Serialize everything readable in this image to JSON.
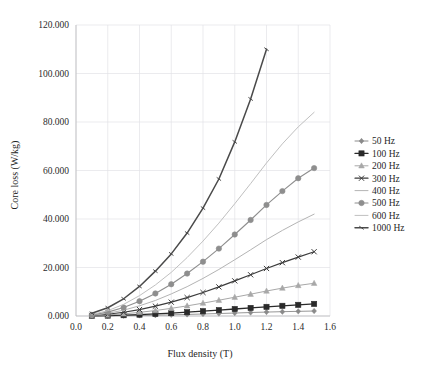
{
  "chart_data": {
    "type": "line",
    "title": "",
    "xlabel": "Flux density (T)",
    "ylabel": "Core loss (W/kg)",
    "xlim": [
      0.0,
      1.6
    ],
    "ylim": [
      0.0,
      120.0
    ],
    "xticks": [
      "0.0",
      "0.2",
      "0.4",
      "0.6",
      "0.8",
      "1.0",
      "1.2",
      "1.4",
      "1.6"
    ],
    "xtick_values": [
      0.0,
      0.2,
      0.4,
      0.6,
      0.8,
      1.0,
      1.2,
      1.4,
      1.6
    ],
    "yticks": [
      "0.000",
      "20.000",
      "40.000",
      "60.000",
      "80.000",
      "100.000",
      "120.000"
    ],
    "ytick_values": [
      0,
      20,
      40,
      60,
      80,
      100,
      120
    ],
    "grid": true,
    "legend_position": "right",
    "x": [
      0.1,
      0.2,
      0.3,
      0.4,
      0.5,
      0.6,
      0.7,
      0.8,
      0.9,
      1.0,
      1.1,
      1.2,
      1.3,
      1.4,
      1.5
    ],
    "series": [
      {
        "name": "50 Hz",
        "label": "50 Hz",
        "color": "#8a8a8a",
        "marker": "diamond",
        "width": 0.9,
        "values": [
          0.02,
          0.06,
          0.13,
          0.22,
          0.34,
          0.48,
          0.64,
          0.82,
          1.02,
          1.22,
          1.43,
          1.62,
          1.78,
          1.92,
          2.05
        ]
      },
      {
        "name": "100 Hz",
        "label": "100 Hz",
        "color": "#2a2a2a",
        "marker": "square",
        "width": 1.3,
        "values": [
          0.05,
          0.16,
          0.33,
          0.56,
          0.85,
          1.18,
          1.56,
          1.98,
          2.42,
          2.88,
          3.33,
          3.77,
          4.2,
          4.6,
          5.0
        ]
      },
      {
        "name": "200 Hz",
        "label": "200 Hz",
        "color": "#a8a8a8",
        "marker": "triangle",
        "width": 1.0,
        "values": [
          0.12,
          0.42,
          0.88,
          1.5,
          2.26,
          3.16,
          4.18,
          5.3,
          6.5,
          7.75,
          9.0,
          10.3,
          11.5,
          12.6,
          13.5
        ]
      },
      {
        "name": "300 Hz",
        "label": "300 Hz",
        "color": "#3c3c3c",
        "marker": "cross",
        "width": 1.2,
        "values": [
          0.2,
          0.72,
          1.55,
          2.66,
          4.05,
          5.7,
          7.6,
          9.7,
          12.0,
          14.5,
          17.0,
          19.6,
          22.0,
          24.3,
          26.5
        ]
      },
      {
        "name": "400 Hz",
        "label": "400 Hz",
        "color": "#b4b4b4",
        "marker": "none",
        "width": 1.0,
        "values": [
          0.3,
          1.1,
          2.4,
          4.2,
          6.4,
          9.1,
          12.1,
          15.5,
          19.2,
          23.2,
          27.3,
          31.5,
          35.3,
          38.8,
          42.0
        ]
      },
      {
        "name": "500 Hz",
        "label": "500 Hz",
        "color": "#8e8e8e",
        "marker": "circle",
        "width": 1.1,
        "values": [
          0.45,
          1.6,
          3.5,
          6.1,
          9.3,
          13.1,
          17.5,
          22.4,
          27.8,
          33.6,
          39.6,
          45.8,
          51.5,
          56.8,
          61.0
        ]
      },
      {
        "name": "600 Hz",
        "label": "600 Hz",
        "color": "#c0c0c0",
        "marker": "none",
        "width": 1.0,
        "values": [
          0.6,
          2.2,
          4.8,
          8.4,
          12.8,
          18.0,
          24.1,
          30.9,
          38.3,
          46.3,
          54.6,
          63.1,
          71.0,
          78.0,
          84.0
        ]
      },
      {
        "name": "1000 Hz",
        "label": "1000 Hz",
        "color": "#4a4a4a",
        "marker": "tick",
        "width": 1.5,
        "x": [
          0.1,
          0.2,
          0.3,
          0.4,
          0.5,
          0.6,
          0.7,
          0.8,
          0.9,
          1.0,
          1.1,
          1.2
        ],
        "values": [
          1.1,
          3.4,
          7.1,
          12.2,
          18.5,
          25.6,
          34.2,
          44.5,
          56.5,
          71.8,
          89.5,
          110.0
        ]
      }
    ]
  },
  "legend": {
    "entries": [
      "50 Hz",
      "100 Hz",
      "200 Hz",
      "300 Hz",
      "400 Hz",
      "500 Hz",
      "600 Hz",
      "1000 Hz"
    ]
  }
}
